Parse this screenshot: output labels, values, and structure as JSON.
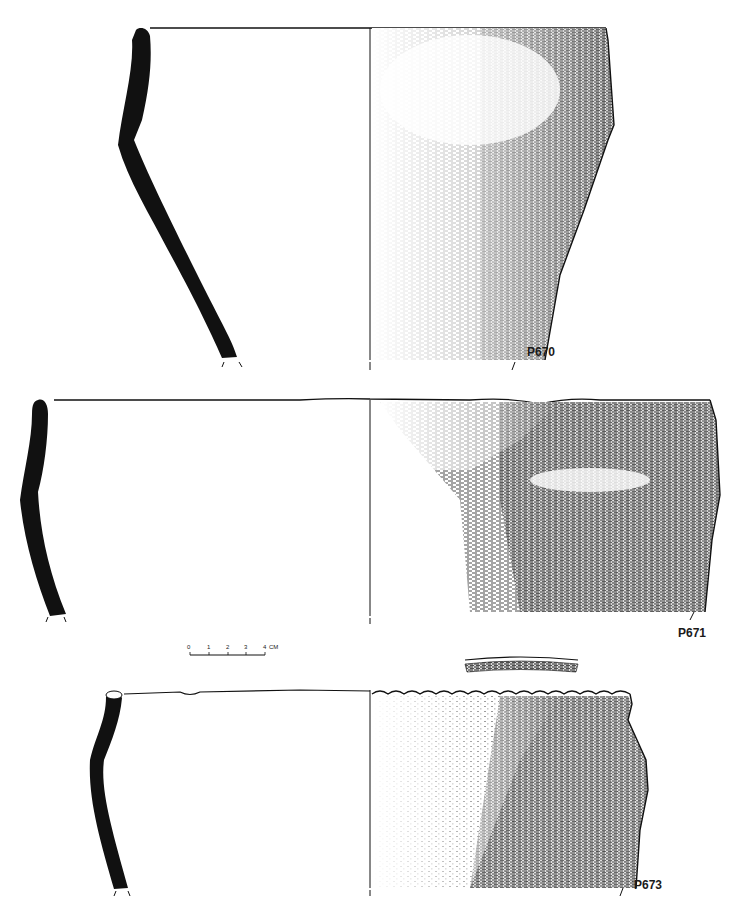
{
  "figure": {
    "vessels": [
      {
        "id": "P670",
        "label": "P670"
      },
      {
        "id": "P671",
        "label": "P671"
      },
      {
        "id": "P673",
        "label": "P673"
      }
    ],
    "scale_bar": {
      "ticks": [
        "0",
        "1",
        "2",
        "3",
        "4"
      ],
      "unit": "CM"
    },
    "colors": {
      "ink": "#141414",
      "profile": "#111111",
      "paper": "#ffffff"
    }
  }
}
